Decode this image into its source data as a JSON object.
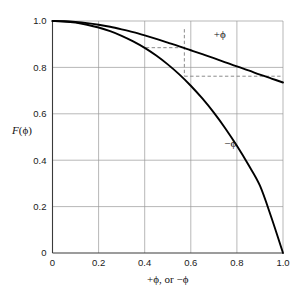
{
  "chart_data": {
    "type": "line",
    "title": "",
    "subtitle": "",
    "xlabel": "+ϕ, or −ϕ",
    "ylabel": "F(ϕ)",
    "xlim": [
      0,
      1.0
    ],
    "ylim": [
      0,
      1.0
    ],
    "grid": true,
    "legend_position": "inline-curve-labels",
    "xticks": [
      0,
      0.2,
      0.4,
      0.6,
      0.8,
      1.0
    ],
    "xtick_labels": [
      "0",
      "0.2",
      "0.4",
      "0.6",
      "0.8",
      "1.0"
    ],
    "yticks": [
      0,
      0.2,
      0.4,
      0.6,
      0.8,
      1.0
    ],
    "ytick_labels": [
      "0",
      "0.2",
      "0.4",
      "0.6",
      "0.8",
      "1.0"
    ],
    "series": [
      {
        "name": "+ϕ",
        "label": "+ϕ",
        "color": "#000000",
        "label_x": 0.7,
        "label_y": 0.925,
        "x": [
          0.0,
          0.05,
          0.1,
          0.15,
          0.2,
          0.25,
          0.3,
          0.35,
          0.4,
          0.45,
          0.5,
          0.55,
          0.6,
          0.65,
          0.7,
          0.75,
          0.8,
          0.85,
          0.9,
          0.95,
          1.0
        ],
        "values": [
          1.0,
          0.999,
          0.996,
          0.991,
          0.984,
          0.975,
          0.964,
          0.952,
          0.938,
          0.923,
          0.907,
          0.891,
          0.874,
          0.857,
          0.84,
          0.822,
          0.804,
          0.787,
          0.769,
          0.752,
          0.735
        ]
      },
      {
        "name": "-ϕ",
        "label": "−ϕ",
        "color": "#000000",
        "label_x": 0.745,
        "label_y": 0.455,
        "x": [
          0.0,
          0.05,
          0.1,
          0.15,
          0.2,
          0.25,
          0.3,
          0.35,
          0.4,
          0.45,
          0.5,
          0.55,
          0.6,
          0.65,
          0.7,
          0.75,
          0.8,
          0.85,
          0.9,
          0.95,
          1.0
        ],
        "values": [
          1.0,
          0.998,
          0.993,
          0.984,
          0.972,
          0.956,
          0.936,
          0.912,
          0.884,
          0.851,
          0.813,
          0.77,
          0.721,
          0.666,
          0.605,
          0.537,
          0.462,
          0.38,
          0.29,
          0.152,
          0.0
        ]
      }
    ],
    "annotations": [
      {
        "name": "guide-horizontal-upper",
        "type": "dashed-segment",
        "x1": 0.405,
        "y1": 0.885,
        "x2": 0.572,
        "y2": 0.885
      },
      {
        "name": "guide-vertical",
        "type": "dashed-segment",
        "x1": 0.572,
        "y1": 0.965,
        "x2": 0.572,
        "y2": 0.762
      },
      {
        "name": "guide-horizontal-lower",
        "type": "dashed-segment",
        "x1": 0.572,
        "y1": 0.762,
        "x2": 1.0,
        "y2": 0.762
      }
    ]
  },
  "figure": {
    "background_color": "#ffffff",
    "axis_color": "#3a3a3a",
    "grid_color": "#9a9a9a",
    "curve_color": "#000000",
    "guide_color": "#8c8c8c"
  }
}
